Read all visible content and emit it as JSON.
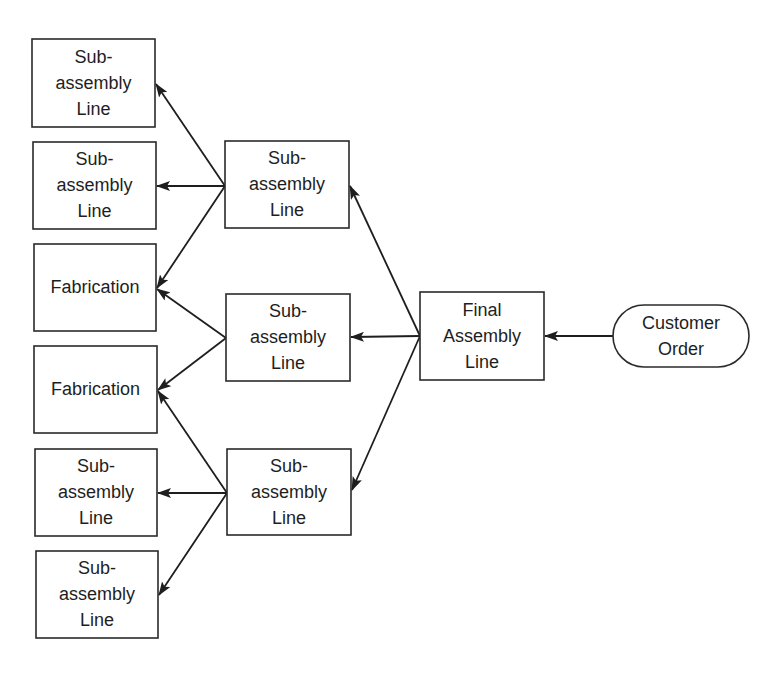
{
  "diagram": {
    "type": "flow",
    "direction": "right-to-left",
    "nodes": [
      {
        "id": "n_sub_l1",
        "label_lines": [
          "Sub-",
          "assembly",
          "Line"
        ],
        "shape": "rect",
        "x": 32,
        "y": 39,
        "w": 123,
        "h": 88
      },
      {
        "id": "n_sub_l2",
        "label_lines": [
          "Sub-",
          "assembly",
          "Line"
        ],
        "shape": "rect",
        "x": 33,
        "y": 142,
        "w": 123,
        "h": 87
      },
      {
        "id": "n_fab_1",
        "label_lines": [
          "Fabrication"
        ],
        "shape": "rect",
        "x": 34,
        "y": 244,
        "w": 122,
        "h": 87
      },
      {
        "id": "n_fab_2",
        "label_lines": [
          "Fabrication"
        ],
        "shape": "rect",
        "x": 34,
        "y": 346,
        "w": 123,
        "h": 87
      },
      {
        "id": "n_sub_l5",
        "label_lines": [
          "Sub-",
          "assembly",
          "Line"
        ],
        "shape": "rect",
        "x": 35,
        "y": 449,
        "w": 122,
        "h": 87
      },
      {
        "id": "n_sub_l6",
        "label_lines": [
          "Sub-",
          "assembly",
          "Line"
        ],
        "shape": "rect",
        "x": 36,
        "y": 551,
        "w": 122,
        "h": 87
      },
      {
        "id": "n_sub_m1",
        "label_lines": [
          "Sub-",
          "assembly",
          "Line"
        ],
        "shape": "rect",
        "x": 225,
        "y": 141,
        "w": 124,
        "h": 87
      },
      {
        "id": "n_sub_m2",
        "label_lines": [
          "Sub-",
          "assembly",
          "Line"
        ],
        "shape": "rect",
        "x": 226,
        "y": 294,
        "w": 124,
        "h": 87
      },
      {
        "id": "n_sub_m3",
        "label_lines": [
          "Sub-",
          "assembly",
          "Line"
        ],
        "shape": "rect",
        "x": 227,
        "y": 449,
        "w": 124,
        "h": 86
      },
      {
        "id": "n_final",
        "label_lines": [
          "Final",
          "Assembly",
          "Line"
        ],
        "shape": "rect",
        "x": 420,
        "y": 292,
        "w": 124,
        "h": 88
      },
      {
        "id": "n_customer",
        "label_lines": [
          "Customer",
          "Order"
        ],
        "shape": "pill",
        "x": 613,
        "y": 305,
        "w": 136,
        "h": 62
      }
    ],
    "edges": [
      {
        "from": "n_customer",
        "to": "n_final",
        "x1": 613,
        "y1": 336,
        "x2": 545,
        "y2": 336
      },
      {
        "from": "n_final",
        "to": "n_sub_m1",
        "x1": 420,
        "y1": 336,
        "x2": 350,
        "y2": 186
      },
      {
        "from": "n_final",
        "to": "n_sub_m2",
        "x1": 420,
        "y1": 336,
        "x2": 351,
        "y2": 337
      },
      {
        "from": "n_final",
        "to": "n_sub_m3",
        "x1": 420,
        "y1": 336,
        "x2": 352,
        "y2": 490
      },
      {
        "from": "n_sub_m1",
        "to": "n_sub_l1",
        "x1": 225,
        "y1": 186,
        "x2": 156,
        "y2": 84
      },
      {
        "from": "n_sub_m1",
        "to": "n_sub_l2",
        "x1": 225,
        "y1": 186,
        "x2": 157,
        "y2": 186
      },
      {
        "from": "n_sub_m1",
        "to": "n_fab_1",
        "x1": 225,
        "y1": 186,
        "x2": 157,
        "y2": 288
      },
      {
        "from": "n_sub_m2",
        "to": "n_fab_1",
        "x1": 226,
        "y1": 338,
        "x2": 157,
        "y2": 289
      },
      {
        "from": "n_sub_m2",
        "to": "n_fab_2",
        "x1": 226,
        "y1": 338,
        "x2": 158,
        "y2": 390
      },
      {
        "from": "n_sub_m3",
        "to": "n_fab_2",
        "x1": 227,
        "y1": 493,
        "x2": 158,
        "y2": 391
      },
      {
        "from": "n_sub_m3",
        "to": "n_sub_l5",
        "x1": 227,
        "y1": 493,
        "x2": 158,
        "y2": 493
      },
      {
        "from": "n_sub_m3",
        "to": "n_sub_l6",
        "x1": 227,
        "y1": 493,
        "x2": 159,
        "y2": 595
      }
    ],
    "colors": {
      "stroke": "#2a2a2a",
      "arrow": "#1e1e1e",
      "text": "#1e1e1e",
      "background": "#ffffff"
    }
  }
}
